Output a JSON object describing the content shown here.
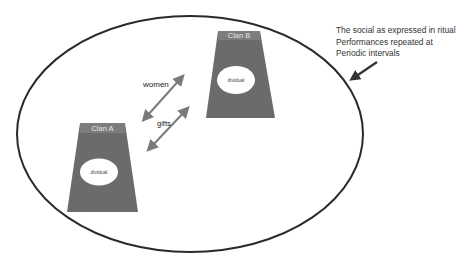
{
  "annotation": {
    "lines": [
      "The social as expressed in ritual",
      "Performances repeated at",
      "Periodic intervals"
    ]
  },
  "exchanges": {
    "women": "women",
    "gifts": "gifts"
  },
  "clans": [
    {
      "label": "Clan A",
      "inner": "dividual"
    },
    {
      "label": "Clan B",
      "inner": "dividual"
    }
  ],
  "colors": {
    "ellipse_stroke": "#2a2a2a",
    "clan_fill": "#6b6b6b",
    "arrow_gray": "#7a7a7a",
    "pointer_arrow": "#333333"
  }
}
